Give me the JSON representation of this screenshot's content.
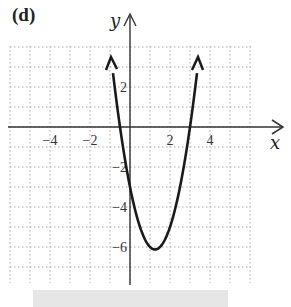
{
  "panel_label": "(d)",
  "chart_data": {
    "type": "line",
    "title": "(d)",
    "xlabel": "x",
    "ylabel": "y",
    "function": "y = 2x^2 - 5x - 3",
    "x_ticks": [
      -4,
      -2,
      2,
      4
    ],
    "y_ticks": [
      2,
      -2,
      -4,
      -6
    ],
    "x_tick_labels": [
      "−4",
      "−2",
      "2",
      "4"
    ],
    "y_tick_labels": [
      "2",
      "−2",
      "−4",
      "−6"
    ],
    "xlim": [
      -6,
      6
    ],
    "ylim": [
      -7.8,
      4
    ],
    "grid": true,
    "vertex": [
      1.25,
      -6.125
    ],
    "roots": [
      -0.5,
      3
    ],
    "y_intercept": -3,
    "x": [
      -0.9,
      -0.5,
      0,
      0.5,
      1,
      1.25,
      1.5,
      2,
      2.5,
      3,
      3.4
    ],
    "y": [
      2.12,
      0,
      -3,
      -5,
      -6,
      -6.125,
      -6,
      -5,
      -3,
      0,
      2.12
    ],
    "endpoints_arrows": true
  },
  "axes": {
    "x_name": "x",
    "y_name": "y"
  }
}
